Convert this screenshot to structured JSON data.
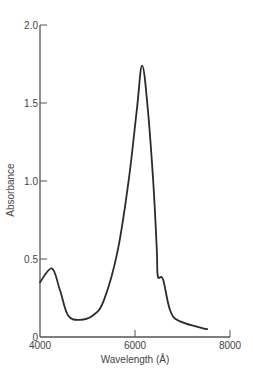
{
  "chart_data": {
    "type": "line",
    "title": "",
    "xlabel": "Wavelength (Å)",
    "ylabel": "Absorbance",
    "xlim": [
      4000,
      8000
    ],
    "ylim": [
      0,
      2.0
    ],
    "x_ticks": [
      4000,
      6000,
      8000
    ],
    "x_tick_labels": [
      "4000",
      "6000",
      "8000"
    ],
    "y_ticks": [
      0,
      0.5,
      1.0,
      1.5,
      2.0
    ],
    "y_tick_labels": [
      "0",
      "0.5",
      "1.0",
      "1.5",
      "2.0"
    ],
    "grid": false,
    "legend": null,
    "series": [
      {
        "name": "Absorbance spectrum",
        "color": "#2b2b2b",
        "x": [
          4000,
          4250,
          4420,
          4590,
          4840,
          5120,
          5350,
          5640,
          5870,
          6040,
          6150,
          6270,
          6380,
          6460,
          6480,
          6590,
          6740,
          6950,
          7520
        ],
        "y": [
          0.35,
          0.44,
          0.3,
          0.14,
          0.11,
          0.14,
          0.24,
          0.56,
          1.01,
          1.46,
          1.74,
          1.46,
          1.01,
          0.56,
          0.39,
          0.37,
          0.17,
          0.1,
          0.05
        ]
      }
    ]
  },
  "colors": {
    "axis": "#555555",
    "line": "#2b2b2b",
    "text": "#444444"
  }
}
